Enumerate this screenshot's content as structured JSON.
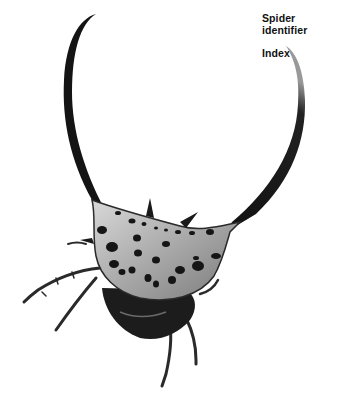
{
  "nav": {
    "spider_identifier": "Spider identifier",
    "index": "Index"
  },
  "illustration": {
    "subject": "spiny orb-weaver spider with long curved horns",
    "colors": {
      "body_dark": "#1a1a1a",
      "abdomen_light": "#b8b8b8",
      "spots": "#151515",
      "background": "#ffffff"
    }
  }
}
